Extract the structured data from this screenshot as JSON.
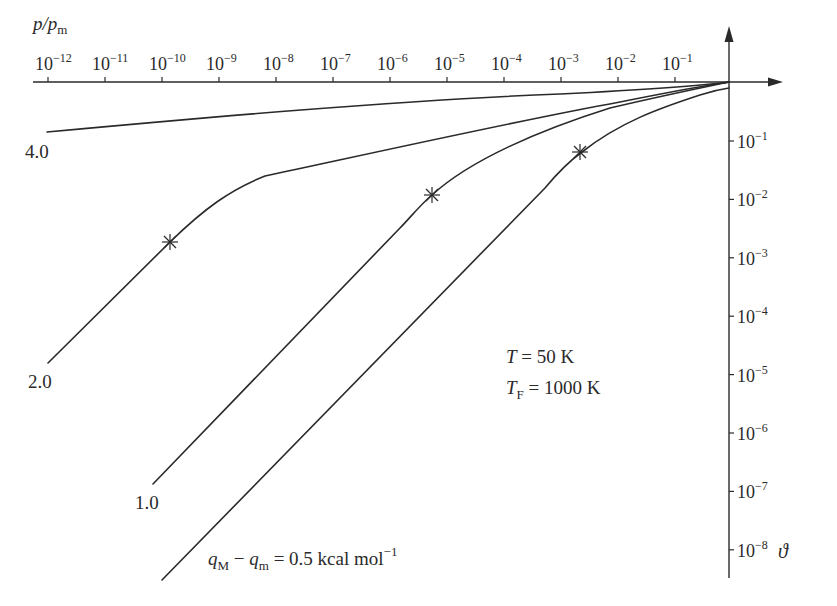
{
  "chart_data": {
    "type": "line",
    "title": "",
    "xlabel": "p/p_m",
    "ylabel": "ϑ",
    "x_scale": "log",
    "y_scale": "log",
    "x_axis_position": "top",
    "y_axis_position": "right",
    "xlim": [
      1e-12,
      1
    ],
    "ylim": [
      1e-08,
      1
    ],
    "grid": false,
    "x_tick_labels": [
      "10^-12",
      "10^-11",
      "10^-10",
      "10^-9",
      "10^-8",
      "10^-7",
      "10^-6",
      "10^-5",
      "10^-4",
      "10^-3",
      "10^-2",
      "10^-1"
    ],
    "y_tick_labels": [
      "10^-1",
      "10^-2",
      "10^-3",
      "10^-4",
      "10^-5",
      "10^-6",
      "10^-7",
      "10^-8"
    ],
    "annotations": [
      "T = 50 K",
      "T_F = 1000 K",
      "q_M − q_m = 0.5 kcal mol^-1"
    ],
    "series": [
      {
        "name": "4.0",
        "marker_points": [],
        "points": [
          [
            1e-12,
            0.15
          ],
          [
            1e-09,
            0.36
          ],
          [
            1e-06,
            0.5
          ],
          [
            0.001,
            0.7
          ],
          [
            0.01,
            0.85
          ],
          [
            1,
            1
          ]
        ]
      },
      {
        "name": "2.0",
        "marker_points": [
          [
            1.2e-10,
            0.0019
          ]
        ],
        "points": [
          [
            1e-12,
            1.6e-05
          ],
          [
            1e-11,
            0.00017
          ],
          [
            1.2e-10,
            0.0019
          ],
          [
            1e-09,
            0.013
          ],
          [
            1e-08,
            0.07
          ],
          [
            1e-07,
            0.18
          ],
          [
            1e-05,
            0.33
          ],
          [
            0.001,
            0.55
          ],
          [
            0.1,
            0.85
          ],
          [
            1,
            1
          ]
        ]
      },
      {
        "name": "1.0",
        "marker_points": [
          [
            5e-06,
            0.012
          ]
        ],
        "points": [
          [
            1e-10,
            1.5e-07
          ],
          [
            1e-08,
            1.3e-05
          ],
          [
            1e-07,
            0.00014
          ],
          [
            1e-06,
            0.0015
          ],
          [
            5e-06,
            0.012
          ],
          [
            0.0001,
            0.13
          ],
          [
            0.001,
            0.3
          ],
          [
            0.01,
            0.55
          ],
          [
            1,
            1
          ]
        ]
      },
      {
        "name": "0.5",
        "marker_points": [
          [
            0.002,
            0.06
          ]
        ],
        "points": [
          [
            1e-10,
            1.2e-08
          ],
          [
            1e-08,
            1e-06
          ],
          [
            1e-06,
            0.0001
          ],
          [
            1e-05,
            0.001
          ],
          [
            0.0001,
            0.01
          ],
          [
            0.002,
            0.06
          ],
          [
            0.01,
            0.15
          ],
          [
            0.1,
            0.4
          ],
          [
            1,
            0.75
          ]
        ]
      }
    ]
  },
  "axes": {
    "x_label_main": "p/p",
    "x_label_sub": "m",
    "y_label": "ϑ",
    "x_ticks": [
      {
        "base": "10",
        "exp": "−12"
      },
      {
        "base": "10",
        "exp": "−11"
      },
      {
        "base": "10",
        "exp": "−10"
      },
      {
        "base": "10",
        "exp": "−9"
      },
      {
        "base": "10",
        "exp": "−8"
      },
      {
        "base": "10",
        "exp": "−7"
      },
      {
        "base": "10",
        "exp": "−6"
      },
      {
        "base": "10",
        "exp": "−5"
      },
      {
        "base": "10",
        "exp": "−4"
      },
      {
        "base": "10",
        "exp": "−3"
      },
      {
        "base": "10",
        "exp": "−2"
      },
      {
        "base": "10",
        "exp": "−1"
      }
    ],
    "y_ticks": [
      {
        "base": "10",
        "exp": "−1"
      },
      {
        "base": "10",
        "exp": "−2"
      },
      {
        "base": "10",
        "exp": "−3"
      },
      {
        "base": "10",
        "exp": "−4"
      },
      {
        "base": "10",
        "exp": "−5"
      },
      {
        "base": "10",
        "exp": "−6"
      },
      {
        "base": "10",
        "exp": "−7"
      },
      {
        "base": "10",
        "exp": "−8"
      }
    ]
  },
  "curve_labels": {
    "c40": "4.0",
    "c20": "2.0",
    "c10": "1.0"
  },
  "annotations": {
    "temp_T": "T",
    "temp_T_value": " = 50 K",
    "temp_TF": "T",
    "temp_TF_sub": "F",
    "temp_TF_value": " = 1000 K",
    "q_M": "q",
    "q_M_sub": "M",
    "q_m": "q",
    "q_m_sub": "m",
    "q_value": " = 0.5 kcal mol",
    "q_exp": "−1",
    "q_minus": " − "
  },
  "colors": {
    "ink": "#2a2a2a",
    "background": "#ffffff"
  }
}
